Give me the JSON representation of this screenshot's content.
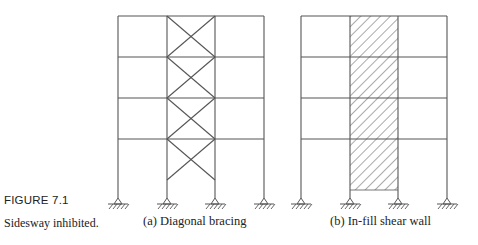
{
  "figure": {
    "number_label": "FIGURE 7.1",
    "caption": "Sidesway inhibited."
  },
  "panels": [
    {
      "id": "a",
      "caption": "(a) Diagonal bracing",
      "bays": 3,
      "stories": 4,
      "braced_bay": 2,
      "bracing_type": "X-bracing"
    },
    {
      "id": "b",
      "caption": "(b) In-fill shear wall",
      "bays": 3,
      "stories": 4,
      "infill_bay": 2,
      "bracing_type": "shear wall (hatched)"
    }
  ],
  "colors": {
    "line": "#555555",
    "text": "#222222"
  }
}
